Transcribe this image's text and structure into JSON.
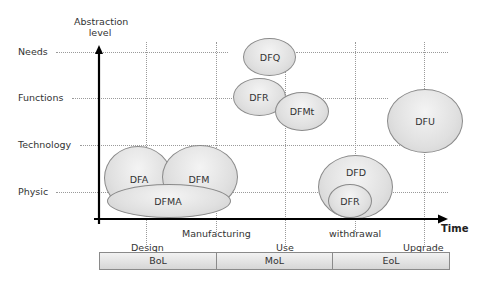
{
  "diagram": {
    "y_axis_title_line1": "Abstraction",
    "y_axis_title_line2": "level",
    "x_axis_title": "Time",
    "levels": [
      "Needs",
      "Functions",
      "Technology",
      "Physic"
    ],
    "stages": {
      "design": "Design",
      "manufacturing": "Manufacturing",
      "use": "Use",
      "withdrawal": "withdrawal",
      "upgrade": "Upgrade"
    },
    "phases": [
      "BoL",
      "MoL",
      "EoL"
    ],
    "ellipses": {
      "dfa": "DFA",
      "dfm": "DFM",
      "dfma": "DFMA",
      "dfq": "DFQ",
      "dfr_top": "DFR",
      "dfmt": "DFMt",
      "dfu": "DFU",
      "dfd": "DFD",
      "dfr_bottom": "DFR"
    }
  }
}
